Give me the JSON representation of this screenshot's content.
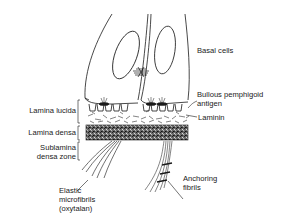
{
  "figure": {
    "colors": {
      "ink": "#1a1a1a",
      "background": "#ffffff",
      "dense_fill": "#555555"
    }
  },
  "labels": {
    "basal_cells": "Basal cells",
    "bullous_pemphigoid_line1": "Bullous pemphigoid",
    "bullous_pemphigoid_line2": "antigen",
    "laminin": "Laminin",
    "lamina_lucida": "Lamina lucida",
    "lamina_densa": "Lamina densa",
    "sublamina_line1": "Sublamina",
    "sublamina_line2": "densa zone",
    "elastic_line1": "Elastic",
    "elastic_line2": "microfibrils",
    "elastic_line3": "(oxytalan)",
    "anchoring_line1": "Anchoring",
    "anchoring_line2": "fibrils"
  }
}
